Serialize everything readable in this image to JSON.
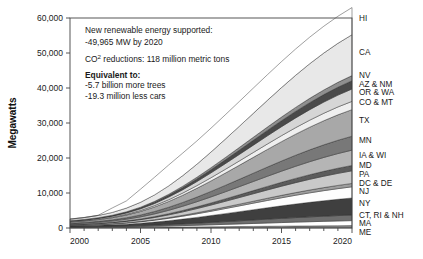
{
  "chart_data": {
    "type": "area",
    "stacked": true,
    "title": "",
    "xlabel": "",
    "ylabel": "Megawatts",
    "xlim": [
      2000,
      2020
    ],
    "ylim": [
      0,
      60000
    ],
    "ytick_labels": [
      "0",
      "10,000",
      "20,000",
      "30,000",
      "40,000",
      "50,000",
      "60,000"
    ],
    "ytick_values": [
      0,
      10000,
      20000,
      30000,
      40000,
      50000,
      60000
    ],
    "xtick_labels": [
      "2000",
      "2005",
      "2010",
      "2015",
      "2020"
    ],
    "xtick_values": [
      2000,
      2005,
      2010,
      2015,
      2020
    ],
    "minor_xticks": true,
    "grid": false,
    "legend_position": "right-outside",
    "x": [
      2000,
      2001,
      2002,
      2003,
      2004,
      2005,
      2006,
      2007,
      2008,
      2009,
      2010,
      2011,
      2012,
      2013,
      2014,
      2015,
      2016,
      2017,
      2018,
      2019,
      2020
    ],
    "series": [
      {
        "name": "ME",
        "color": "#8c8c8c",
        "values": [
          120,
          130,
          145,
          160,
          180,
          200,
          225,
          255,
          285,
          315,
          350,
          385,
          420,
          455,
          490,
          525,
          560,
          590,
          620,
          650,
          680
        ]
      },
      {
        "name": "MA",
        "color": "#ffffff",
        "values": [
          90,
          100,
          115,
          135,
          165,
          205,
          260,
          325,
          400,
          480,
          565,
          655,
          745,
          840,
          935,
          1030,
          1120,
          1205,
          1285,
          1360,
          1430
        ]
      },
      {
        "name": "CT, RI & NH",
        "color": "#6e6e6e",
        "values": [
          110,
          125,
          145,
          175,
          215,
          265,
          330,
          405,
          490,
          585,
          685,
          790,
          895,
          1000,
          1105,
          1205,
          1300,
          1390,
          1470,
          1545,
          1610
        ]
      },
      {
        "name": "NY",
        "color": "#3f3f3f",
        "values": [
          260,
          300,
          355,
          430,
          540,
          690,
          880,
          1105,
          1365,
          1650,
          1955,
          2275,
          2600,
          2925,
          3250,
          3565,
          3865,
          4145,
          4405,
          4640,
          4850
        ]
      },
      {
        "name": "NJ",
        "color": "#fdfdfd",
        "values": [
          140,
          165,
          200,
          250,
          320,
          415,
          535,
          680,
          845,
          1030,
          1230,
          1440,
          1655,
          1875,
          2095,
          2310,
          2515,
          2710,
          2890,
          3055,
          3200
        ]
      },
      {
        "name": "DC & DE",
        "color": "#9e9e9e",
        "values": [
          40,
          48,
          58,
          72,
          92,
          120,
          155,
          198,
          248,
          303,
          362,
          425,
          490,
          556,
          622,
          688,
          752,
          812,
          868,
          920,
          965
        ]
      },
      {
        "name": "PA",
        "color": "#c9c9c9",
        "values": [
          170,
          200,
          240,
          298,
          378,
          485,
          622,
          788,
          978,
          1188,
          1412,
          1648,
          1890,
          2135,
          2380,
          2620,
          2850,
          3065,
          3265,
          3445,
          3600
        ]
      },
      {
        "name": "MD",
        "color": "#5c5c5c",
        "values": [
          70,
          82,
          98,
          122,
          155,
          200,
          258,
          328,
          408,
          497,
          592,
          692,
          795,
          900,
          1005,
          1108,
          1208,
          1302,
          1390,
          1468,
          1538
        ]
      },
      {
        "name": "IA & WI",
        "color": "#b5b5b5",
        "values": [
          210,
          245,
          295,
          365,
          465,
          598,
          768,
          972,
          1205,
          1462,
          1735,
          2020,
          2312,
          2608,
          2902,
          3190,
          3468,
          3728,
          3968,
          4185,
          4375
        ]
      },
      {
        "name": "MN",
        "color": "#787878",
        "values": [
          180,
          212,
          258,
          322,
          412,
          532,
          685,
          870,
          1082,
          1315,
          1565,
          1825,
          2092,
          2362,
          2630,
          2892,
          3145,
          3382,
          3600,
          3798,
          3972
        ]
      },
      {
        "name": "TX",
        "color": "#a8a8a8",
        "values": [
          330,
          392,
          478,
          600,
          772,
          1002,
          1295,
          1652,
          2062,
          2515,
          2998,
          3500,
          4012,
          4525,
          5035,
          5535,
          6018,
          6472,
          6890,
          7268,
          7600
        ]
      },
      {
        "name": "CO & MT",
        "color": "#efefef",
        "values": [
          95,
          112,
          138,
          175,
          228,
          298,
          388,
          498,
          625,
          766,
          918,
          1075,
          1235,
          1395,
          1555,
          1712,
          1862,
          2005,
          2138,
          2258,
          2365
        ]
      },
      {
        "name": "OR & WA",
        "color": "#d6d6d6",
        "values": [
          150,
          178,
          218,
          275,
          355,
          462,
          598,
          762,
          952,
          1162,
          1388,
          1622,
          1858,
          2098,
          2335,
          2568,
          2792,
          3005,
          3202,
          3380,
          3538
        ]
      },
      {
        "name": "AZ & NM",
        "color": "#4a4a4a",
        "values": [
          85,
          102,
          128,
          165,
          218,
          288,
          378,
          488,
          615,
          757,
          908,
          1065,
          1225,
          1385,
          1545,
          1702,
          1852,
          1995,
          2128,
          2248,
          2355
        ]
      },
      {
        "name": "NV",
        "color": "#8f8f8f",
        "values": [
          55,
          66,
          82,
          105,
          138,
          182,
          238,
          306,
          385,
          472,
          565,
          662,
          760,
          860,
          958,
          1055,
          1148,
          1238,
          1320,
          1395,
          1462
        ]
      },
      {
        "name": "CA",
        "color": "#e8e8e8",
        "values": [
          420,
          505,
          625,
          800,
          1055,
          1400,
          1848,
          2395,
          3025,
          3728,
          4478,
          5252,
          6042,
          6838,
          7632,
          8415,
          9172,
          9888,
          10552,
          11152,
          11680
        ]
      },
      {
        "name": "HI",
        "color": "#ffffff",
        "values": [
          40,
          50,
          62,
          1280,
          2050,
          3750,
          5050,
          5980,
          6450,
          6650,
          6820,
          6960,
          7090,
          7210,
          7320,
          7420,
          7510,
          7590,
          7660,
          7720,
          7770
        ]
      }
    ],
    "total_2020": 49965,
    "annotation": {
      "line1": "New renewable energy supported:",
      "line2": "-49,965 MW by 2020",
      "line3_pre": "CO",
      "line3_sup": "2",
      "line3_post": " reductions: 118 million metric tons",
      "line4": "Equivalent to:",
      "line5": "-5.7 billion more trees",
      "line6": "-19.3 million less cars"
    }
  }
}
